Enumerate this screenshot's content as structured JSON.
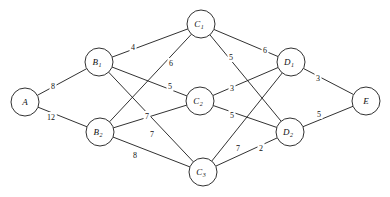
{
  "diagram": {
    "type": "node-link-diagram",
    "background_color": "#ffffff",
    "line_color": "#1a1a1a",
    "nodes": [
      {
        "id": "A",
        "label": "A",
        "subscript": "",
        "x": 25,
        "y": 102,
        "r": 14,
        "layer": "source"
      },
      {
        "id": "B1",
        "label": "B",
        "subscript": "1",
        "x": 99,
        "y": 62,
        "r": 14,
        "layer": "B"
      },
      {
        "id": "B2",
        "label": "B",
        "subscript": "2",
        "x": 100,
        "y": 132,
        "r": 14,
        "layer": "B"
      },
      {
        "id": "C1",
        "label": "C",
        "subscript": "1",
        "x": 201,
        "y": 24,
        "r": 14,
        "layer": "C"
      },
      {
        "id": "C2",
        "label": "C",
        "subscript": "2",
        "x": 200,
        "y": 101,
        "r": 14,
        "layer": "C"
      },
      {
        "id": "C3",
        "label": "C",
        "subscript": "3",
        "x": 203,
        "y": 172,
        "r": 14,
        "layer": "C"
      },
      {
        "id": "D1",
        "label": "D",
        "subscript": "1",
        "x": 291,
        "y": 62,
        "r": 14,
        "layer": "D"
      },
      {
        "id": "D2",
        "label": "D",
        "subscript": "2",
        "x": 290,
        "y": 132,
        "r": 14,
        "layer": "D"
      },
      {
        "id": "E",
        "label": "E",
        "subscript": "",
        "x": 366,
        "y": 101,
        "r": 14,
        "layer": "sink"
      }
    ],
    "edges": [
      {
        "from": "A",
        "to": "B1",
        "weight": "8",
        "lx": 53,
        "ly": 86
      },
      {
        "from": "A",
        "to": "B2",
        "weight": "12",
        "lx": 51,
        "ly": 117
      },
      {
        "from": "B1",
        "to": "C1",
        "weight": "4",
        "lx": 133,
        "ly": 47
      },
      {
        "from": "B1",
        "to": "C2",
        "weight": "6",
        "lx": 171,
        "ly": 63
      },
      {
        "from": "B1",
        "to": "C3",
        "weight": "5",
        "lx": 170,
        "ly": 86
      },
      {
        "from": "B2",
        "to": "C1",
        "weight": "7",
        "lx": 147,
        "ly": 116
      },
      {
        "from": "B2",
        "to": "C2",
        "weight": "7",
        "lx": 152,
        "ly": 134
      },
      {
        "from": "B2",
        "to": "C3",
        "weight": "8",
        "lx": 135,
        "ly": 155
      },
      {
        "from": "C1",
        "to": "D1",
        "weight": "6",
        "lx": 265,
        "ly": 50
      },
      {
        "from": "C1",
        "to": "D2",
        "weight": "5",
        "lx": 231,
        "ly": 57
      },
      {
        "from": "C2",
        "to": "D1",
        "weight": "3",
        "lx": 232,
        "ly": 88
      },
      {
        "from": "C2",
        "to": "D2",
        "weight": "5",
        "lx": 232,
        "ly": 115
      },
      {
        "from": "C3",
        "to": "D1",
        "weight": "7",
        "lx": 238,
        "ly": 148
      },
      {
        "from": "C3",
        "to": "D2",
        "weight": "2",
        "lx": 261,
        "ly": 148
      },
      {
        "from": "D1",
        "to": "E",
        "weight": "3",
        "lx": 318,
        "ly": 78
      },
      {
        "from": "D2",
        "to": "E",
        "weight": "5",
        "lx": 319,
        "ly": 114
      }
    ]
  }
}
